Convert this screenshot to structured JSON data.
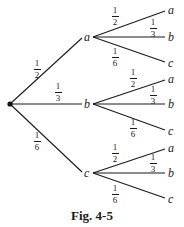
{
  "figure": {
    "caption": "Fig. 4-5",
    "root": {
      "label": ""
    },
    "level1": [
      {
        "label": "a",
        "prob": {
          "num": "1",
          "den": "2"
        },
        "children": [
          {
            "label": "a",
            "prob": {
              "num": "1",
              "den": "2"
            }
          },
          {
            "label": "b",
            "prob": {
              "num": "1",
              "den": "3"
            }
          },
          {
            "label": "c",
            "prob": {
              "num": "1",
              "den": "6"
            }
          }
        ]
      },
      {
        "label": "b",
        "prob": {
          "num": "1",
          "den": "3"
        },
        "children": [
          {
            "label": "a",
            "prob": {
              "num": "1",
              "den": "2"
            }
          },
          {
            "label": "b",
            "prob": {
              "num": "1",
              "den": "3"
            }
          },
          {
            "label": "c",
            "prob": {
              "num": "1",
              "den": "6"
            }
          }
        ]
      },
      {
        "label": "c",
        "prob": {
          "num": "1",
          "den": "6"
        },
        "children": [
          {
            "label": "a",
            "prob": {
              "num": "1",
              "den": "2"
            }
          },
          {
            "label": "b",
            "prob": {
              "num": "1",
              "den": "3"
            }
          },
          {
            "label": "c",
            "prob": {
              "num": "1",
              "den": "6"
            }
          }
        ]
      }
    ]
  }
}
